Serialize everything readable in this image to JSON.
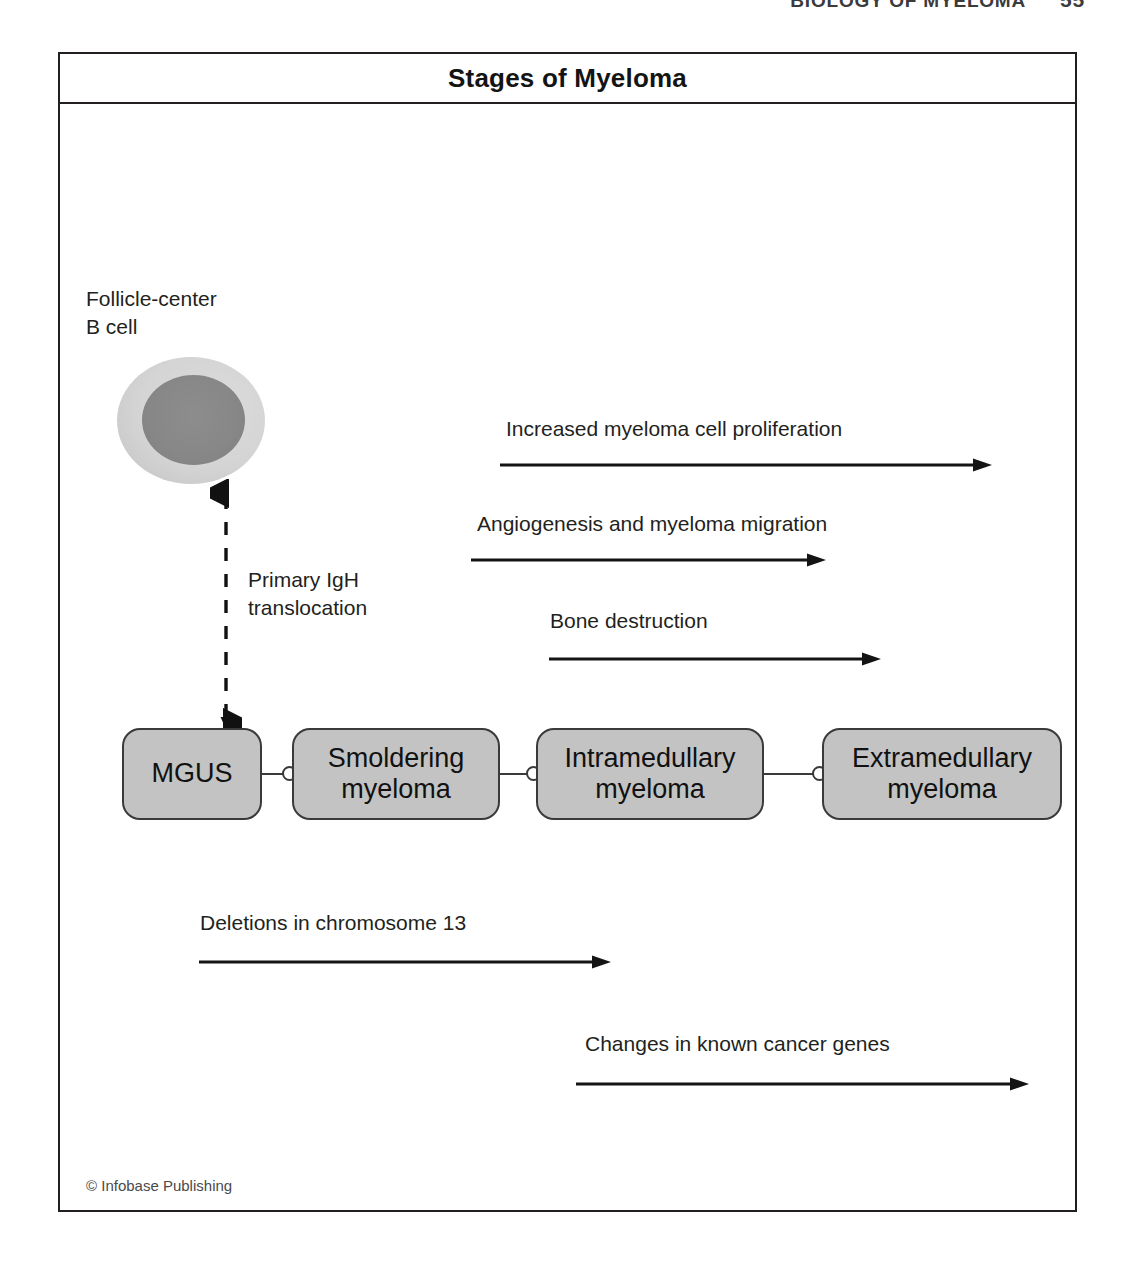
{
  "page": {
    "running_head": "BIOLOGY OF MYELOMA",
    "folio": "55"
  },
  "figure": {
    "title": "Stages of Myeloma",
    "credit": "© Infobase Publishing",
    "cell": {
      "label": "Follicle-center\nB cell",
      "membrane_color": "#d4d4d4",
      "nucleus_color": "#878787"
    },
    "translocation": {
      "label": "Primary IgH\ntranslocation",
      "arrow_style": "dashed-double-headed-vertical"
    },
    "stages": [
      {
        "label": "MGUS",
        "left": 62,
        "width": 140
      },
      {
        "label": "Smoldering\nmyeloma",
        "left": 232,
        "width": 208
      },
      {
        "label": "Intramedullary\nmyeloma",
        "left": 476,
        "width": 228
      },
      {
        "label": "Extramedullary\nmyeloma",
        "left": 762,
        "width": 240
      }
    ],
    "box_fill_color": "#c3c3c3",
    "box_border_color": "#3a3a3a",
    "process_arrows": [
      {
        "label": "Increased myeloma cell proliferation",
        "label_left": 446,
        "label_top": 313,
        "line_left": 440,
        "line_top": 352,
        "line_width": 492
      },
      {
        "label": "Angiogenesis and myeloma migration",
        "label_left": 417,
        "label_top": 408,
        "line_left": 411,
        "line_top": 447,
        "line_width": 355
      },
      {
        "label": "Bone destruction",
        "label_left": 490,
        "label_top": 505,
        "line_left": 489,
        "line_top": 546,
        "line_width": 332
      },
      {
        "label": "Deletions in chromosome 13",
        "label_left": 140,
        "label_top": 807,
        "line_left": 139,
        "line_top": 849,
        "line_width": 412
      },
      {
        "label": "Changes in known cancer genes",
        "label_left": 525,
        "label_top": 928,
        "line_left": 516,
        "line_top": 971,
        "line_width": 453
      }
    ]
  }
}
